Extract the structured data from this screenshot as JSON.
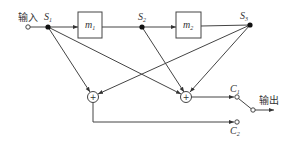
{
  "input_label": "输入",
  "output_label": "输出",
  "nodes": {
    "s1": {
      "name": "S",
      "sub": "1"
    },
    "s2": {
      "name": "S",
      "sub": "2"
    },
    "s3": {
      "name": "S",
      "sub": "3"
    }
  },
  "blocks": {
    "m1": {
      "name": "m",
      "sub": "1"
    },
    "m2": {
      "name": "m",
      "sub": "2"
    }
  },
  "adders": {
    "left": {
      "symbol": "+"
    },
    "right": {
      "symbol": "+"
    }
  },
  "switch": {
    "c1": {
      "name": "C",
      "sub": "1"
    },
    "c2": {
      "name": "C",
      "sub": "2"
    }
  }
}
